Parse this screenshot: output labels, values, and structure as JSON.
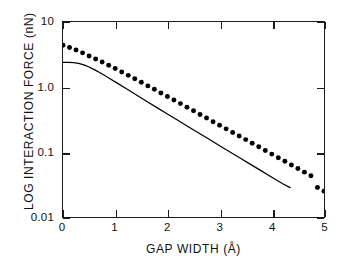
{
  "chart_data": {
    "type": "scatter",
    "title": "",
    "xlabel": "GAP WIDTH  (Å)",
    "ylabel": "LOG INTERACTION FORCE  (nN)",
    "xlim": [
      0,
      5
    ],
    "ylim": [
      0.01,
      10
    ],
    "yscale": "log",
    "xscale": "linear",
    "grid": false,
    "legend": "none",
    "xticks": [
      0,
      1,
      2,
      3,
      4,
      5
    ],
    "xtick_labels": [
      "0",
      "1",
      "2",
      "3",
      "4",
      "5"
    ],
    "yticks": [
      10,
      1.0,
      0.1,
      0.01
    ],
    "ytick_labels": [
      "10",
      "1.0",
      "0.1",
      "0.01"
    ],
    "series": [
      {
        "name": "measured data points",
        "marker": "filled-circle",
        "style": "dots",
        "color": "#000000",
        "x": [
          0,
          0.125,
          0.25,
          0.375,
          0.5,
          0.625,
          0.75,
          0.875,
          1.0,
          1.125,
          1.25,
          1.375,
          1.5,
          1.625,
          1.75,
          1.875,
          2.0,
          2.125,
          2.25,
          2.375,
          2.5,
          2.625,
          2.75,
          2.875,
          3.0,
          3.125,
          3.25,
          3.375,
          3.5,
          3.625,
          3.75,
          3.875,
          4.0,
          4.125,
          4.25,
          4.375,
          4.5,
          4.625,
          4.75,
          4.875,
          5.0
        ],
        "y": [
          4.4,
          4.05,
          3.7,
          3.35,
          3.0,
          2.7,
          2.42,
          2.16,
          1.92,
          1.7,
          1.51,
          1.34,
          1.18,
          1.04,
          0.92,
          0.81,
          0.715,
          0.63,
          0.555,
          0.488,
          0.43,
          0.378,
          0.333,
          0.293,
          0.258,
          0.227,
          0.2,
          0.176,
          0.155,
          0.136,
          0.12,
          0.1055,
          0.0928,
          0.0817,
          0.0719,
          0.0633,
          0.0557,
          0.049,
          0.0431,
          0.0285,
          0.025
        ]
      },
      {
        "name": "theoretical curve",
        "marker": "none",
        "style": "solid-line",
        "color": "#000000",
        "x": [
          0,
          0.1,
          0.2,
          0.3,
          0.4,
          0.5,
          0.6,
          0.7,
          0.8,
          0.9,
          1.0,
          1.2,
          1.4,
          1.6,
          1.8,
          2.0,
          2.2,
          2.4,
          2.6,
          2.8,
          3.0,
          3.2,
          3.4,
          3.6,
          3.8,
          4.0,
          4.2,
          4.35
        ],
        "y": [
          2.4,
          2.4,
          2.38,
          2.31,
          2.19,
          2.03,
          1.85,
          1.67,
          1.5,
          1.34,
          1.2,
          0.955,
          0.76,
          0.605,
          0.482,
          0.385,
          0.307,
          0.245,
          0.196,
          0.157,
          0.125,
          0.1,
          0.08,
          0.064,
          0.0512,
          0.041,
          0.0328,
          0.0283
        ]
      }
    ],
    "annotations": []
  }
}
